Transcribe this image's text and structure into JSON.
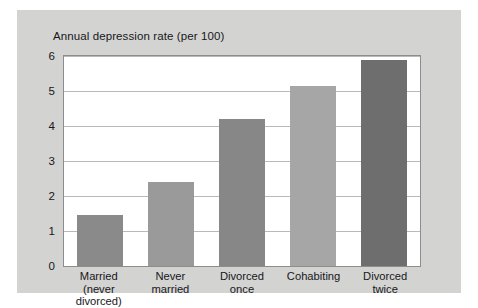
{
  "figure": {
    "title": "Annual depression rate (per 100)",
    "panel_color": "#d3d3d2",
    "plot_background": "#ffffff",
    "frame_color": "#8d8d8d",
    "gridline_color": "#b9b9b9"
  },
  "chart_data": {
    "type": "bar",
    "title": "Annual depression rate (per 100)",
    "xlabel": "",
    "ylabel": "",
    "ylim": [
      0,
      6
    ],
    "yticks": [
      0,
      1,
      2,
      3,
      4,
      5,
      6
    ],
    "ytick_labels": [
      "0",
      "1",
      "2",
      "3",
      "4",
      "5",
      "6"
    ],
    "grid": true,
    "legend": "none",
    "categories": [
      "Married (never divorced)",
      "Never married",
      "Divorced once",
      "Cohabiting",
      "Divorced twice"
    ],
    "category_lines": [
      {
        "line1": "Married",
        "line2": "(never divorced)"
      },
      {
        "line1": "Never",
        "line2": "married"
      },
      {
        "line1": "Divorced",
        "line2": "once"
      },
      {
        "line1": "Cohabiting",
        "line2": ""
      },
      {
        "line1": "Divorced",
        "line2": "twice"
      }
    ],
    "values": [
      1.45,
      2.4,
      4.2,
      5.15,
      5.9
    ],
    "bar_colors": [
      "#8a8a8a",
      "#9a9a9a",
      "#878787",
      "#a6a6a6",
      "#6e6e6e"
    ]
  }
}
